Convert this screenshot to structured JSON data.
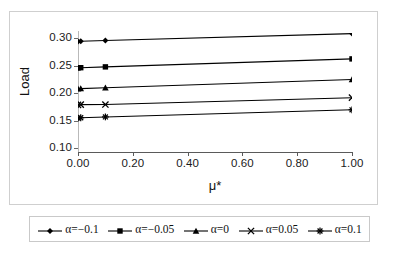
{
  "chart_data": {
    "type": "line",
    "title": "",
    "xlabel": "μ*",
    "ylabel": "Load",
    "xlim": [
      0.0,
      1.0
    ],
    "ylim": [
      0.1,
      0.3
    ],
    "grid": false,
    "legend_position": "bottom",
    "x_ticks": [
      "0.00",
      "0.20",
      "0.40",
      "0.60",
      "0.80",
      "1.00"
    ],
    "x_tick_values": [
      0.0,
      0.2,
      0.4,
      0.6,
      0.8,
      1.0
    ],
    "y_ticks": [
      "0.10",
      "0.15",
      "0.20",
      "0.25",
      "0.30"
    ],
    "y_tick_values": [
      0.1,
      0.15,
      0.2,
      0.25,
      0.3
    ],
    "x": [
      0.0,
      0.01,
      0.1,
      1.0
    ],
    "series": [
      {
        "name": "α=−0.1",
        "marker": "diamond",
        "values": [
          0.2935,
          0.294,
          0.2955,
          0.308
        ]
      },
      {
        "name": "α=−0.05",
        "marker": "square",
        "values": [
          0.2455,
          0.246,
          0.2475,
          0.262
        ]
      },
      {
        "name": "α=0",
        "marker": "triangle",
        "values": [
          0.2075,
          0.208,
          0.2095,
          0.2245
        ]
      },
      {
        "name": "α=0.05",
        "marker": "cross",
        "values": [
          0.1785,
          0.1788,
          0.179,
          0.1915
        ]
      },
      {
        "name": "α=0.1",
        "marker": "asterisk",
        "values": [
          0.1545,
          0.155,
          0.1565,
          0.1695
        ]
      }
    ]
  },
  "axes": {
    "y_title": "Load",
    "x_title": "μ*"
  },
  "legend": {
    "entries": [
      {
        "label": "α=−0.1",
        "marker": "diamond"
      },
      {
        "label": "α=−0.05",
        "marker": "square"
      },
      {
        "label": "α=0",
        "marker": "triangle"
      },
      {
        "label": "α=0.05",
        "marker": "cross"
      },
      {
        "label": "α=0.1",
        "marker": "asterisk"
      }
    ]
  },
  "colors": {
    "series_line": "#000000",
    "axis": "#5a5a5a",
    "frame": "#cfcfcf",
    "text": "#111111"
  }
}
